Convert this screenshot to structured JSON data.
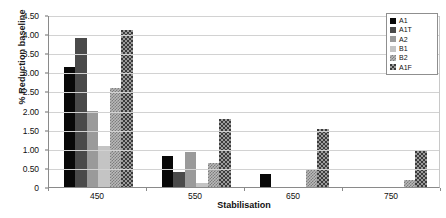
{
  "chart_data": {
    "type": "bar",
    "title": "",
    "xlabel": "Stabilisation",
    "ylabel": "% Reduction baseline",
    "categories": [
      "450",
      "550",
      "650",
      "750"
    ],
    "ylim": [
      0,
      4.5
    ],
    "ytick_labels": [
      "0",
      "0.50",
      "1.00",
      "1.50",
      "2.00",
      "2.50",
      "3.00",
      "3.50",
      "4.00",
      "4.50"
    ],
    "ytick_values": [
      0,
      0.5,
      1.0,
      1.5,
      2.0,
      2.5,
      3.0,
      3.5,
      4.0,
      4.5
    ],
    "grid": true,
    "legend_position": "top-right",
    "series": [
      {
        "name": "A1",
        "color": "#080808",
        "pattern": "solid",
        "values": [
          3.13,
          0.8,
          0.35,
          0.0
        ]
      },
      {
        "name": "A1T",
        "color": "#4a4a4a",
        "pattern": "solid",
        "values": [
          3.9,
          0.38,
          0.0,
          0.0
        ]
      },
      {
        "name": "A2",
        "color": "#9a9a9a",
        "pattern": "solid",
        "values": [
          2.0,
          0.92,
          0.0,
          0.0
        ]
      },
      {
        "name": "B1",
        "color": "#c4c4c4",
        "pattern": "solid",
        "values": [
          1.08,
          0.11,
          0.0,
          0.0
        ]
      },
      {
        "name": "B2",
        "color": "#b9b9b9",
        "pattern": "fine-check",
        "values": [
          2.58,
          0.64,
          0.45,
          0.18
        ]
      },
      {
        "name": "A1F",
        "color": "#3b3b3b",
        "pattern": "bold-check",
        "values": [
          4.12,
          1.78,
          1.52,
          0.95
        ]
      }
    ]
  }
}
